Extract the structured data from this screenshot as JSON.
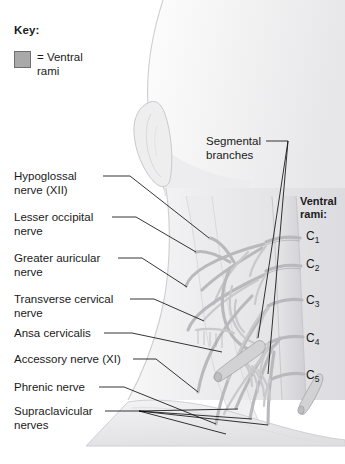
{
  "figure": {
    "background_color": "#ffffff"
  },
  "key": {
    "title": "Key:",
    "swatch_color": "#a9a9a9",
    "swatch_border_color": "#6e6e6e",
    "entry_label": "= Ventral\nrami"
  },
  "segmental": {
    "label": "Segmental\nbranches"
  },
  "ventral_rami": {
    "heading": "Ventral\nrami:",
    "roots": [
      {
        "letter": "C",
        "index": "1",
        "top": 229
      },
      {
        "letter": "C",
        "index": "2",
        "top": 257
      },
      {
        "letter": "C",
        "index": "3",
        "top": 293
      },
      {
        "letter": "C",
        "index": "4",
        "top": 331
      },
      {
        "letter": "C",
        "index": "5",
        "top": 368
      }
    ]
  },
  "left_labels": [
    {
      "name": "hypoglossal-nerve",
      "text": "Hypoglossal\nnerve (XII)",
      "top": 170
    },
    {
      "name": "lesser-occipital-nerve",
      "text": "Lesser occipital\nnerve",
      "top": 211
    },
    {
      "name": "greater-auricular-nerve",
      "text": "Greater auricular\nnerve",
      "top": 252
    },
    {
      "name": "transverse-cervical-nerve",
      "text": "Transverse cervical\nnerve",
      "top": 293
    },
    {
      "name": "ansa-cervicalis",
      "text": "Ansa cervicalis",
      "top": 327
    },
    {
      "name": "accessory-nerve",
      "text": "Accessory nerve (XI)",
      "top": 353
    },
    {
      "name": "phrenic-nerve",
      "text": "Phrenic nerve",
      "top": 381
    },
    {
      "name": "supraclavicular-nerves",
      "text": "Supraclavicular\nnerves",
      "top": 405
    }
  ]
}
